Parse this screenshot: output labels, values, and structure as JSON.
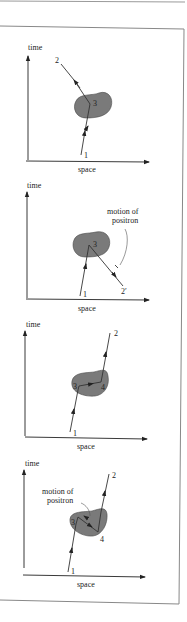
{
  "figure": {
    "panels": [
      {
        "id": "panel-1",
        "axis_time_label": "time",
        "axis_space_label": "space",
        "points": [
          "1",
          "2",
          "3"
        ],
        "annotation": ""
      },
      {
        "id": "panel-2",
        "axis_time_label": "time",
        "axis_space_label": "space",
        "points": [
          "1",
          "2′",
          "3"
        ],
        "annotation_line1": "motion of",
        "annotation_line2": "positron"
      },
      {
        "id": "panel-3",
        "axis_time_label": "time",
        "axis_space_label": "space",
        "points": [
          "1",
          "2",
          "3",
          "4"
        ],
        "annotation": ""
      },
      {
        "id": "panel-4",
        "axis_time_label": "time",
        "axis_space_label": "space",
        "points": [
          "1",
          "2",
          "3",
          "4"
        ],
        "annotation_line1": "motion of",
        "annotation_line2": "positron"
      }
    ],
    "colors": {
      "blob": "#7a7a7a",
      "blob_stroke": "#4a4a4a",
      "line": "#333333",
      "frame": "#888888"
    }
  }
}
